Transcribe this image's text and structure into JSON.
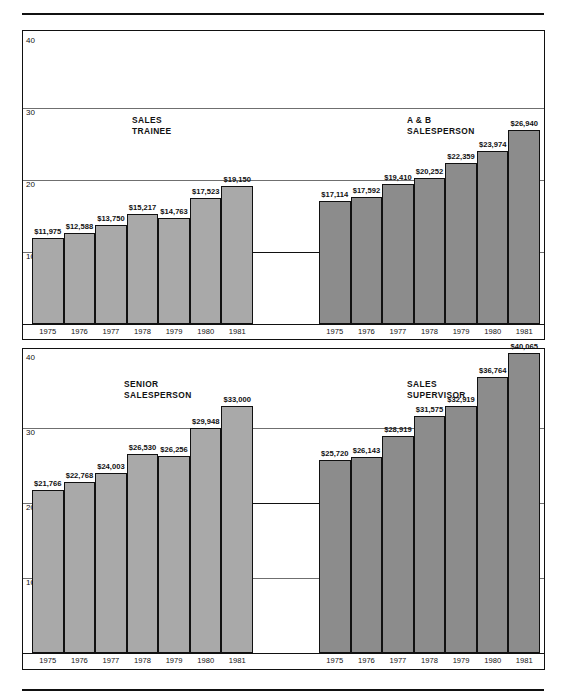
{
  "chart_data": {
    "type": "bar",
    "title": "",
    "xlabel": "",
    "ylabel": "",
    "categories": [
      "1975",
      "1976",
      "1977",
      "1978",
      "1979",
      "1980",
      "1981"
    ],
    "axis_unit": "thousands of dollars",
    "upper_panel": {
      "ylim": [
        0,
        40
      ],
      "yticks": [
        "40",
        "30",
        "20",
        "10"
      ],
      "grid": true
    },
    "lower_panel": {
      "ylim": [
        0,
        40
      ],
      "yticks": [
        "40",
        "30",
        "20",
        "10"
      ],
      "grid": true
    },
    "series": [
      {
        "name": "SALES\nTRAINEE",
        "panel": "upper",
        "side": "left",
        "shade": "light",
        "values": [
          11975,
          12588,
          13750,
          15217,
          14763,
          17523,
          19150
        ],
        "labels": [
          "$11,975",
          "$12,588",
          "$13,750",
          "$15,217",
          "$14,763",
          "$17,523",
          "$19,150"
        ]
      },
      {
        "name": "A & B\nSALESPERSON",
        "panel": "upper",
        "side": "right",
        "shade": "dark",
        "values": [
          17114,
          17592,
          19410,
          20252,
          22359,
          23974,
          26940
        ],
        "labels": [
          "$17,114",
          "$17,592",
          "$19,410",
          "$20,252",
          "$22,359",
          "$23,974",
          "$26,940"
        ]
      },
      {
        "name": "SENIOR\nSALESPERSON",
        "panel": "lower",
        "side": "left",
        "shade": "light",
        "values": [
          21766,
          22768,
          24003,
          26530,
          26256,
          29948,
          33000
        ],
        "labels": [
          "$21,766",
          "$22,768",
          "$24,003",
          "$26,530",
          "$26,256",
          "$29,948",
          "$33,000"
        ]
      },
      {
        "name": "SALES\nSUPERVISOR",
        "panel": "lower",
        "side": "right",
        "shade": "dark",
        "values": [
          25720,
          26143,
          28919,
          31575,
          32919,
          36764,
          40065
        ],
        "labels": [
          "$25,720",
          "$26,143",
          "$28,919",
          "$31,575",
          "$32,919",
          "$36,764",
          "$40,065"
        ]
      }
    ],
    "colors": {
      "bar_light": "#a9a9a9",
      "bar_dark": "#8c8c8c",
      "outline": "#111111",
      "gridline": "#6f6f6f",
      "background": "#ffffff"
    }
  }
}
